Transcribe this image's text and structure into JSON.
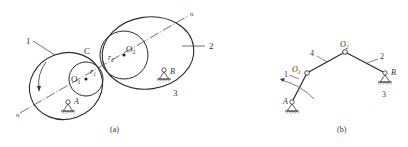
{
  "panel_a": {
    "caption": "(a)",
    "labels": {
      "link1": "1",
      "link2": "2",
      "link3": "3",
      "point_c": "C",
      "center_o1": "O",
      "center_o1_sub": "1",
      "center_o2": "O",
      "center_o2_sub": "2",
      "radius_r1": "r",
      "radius_r1_sub": "1",
      "radius_r2": "r",
      "radius_r2_sub": "2",
      "pivot_a": "A",
      "pivot_b": "B",
      "line_n_top": "n",
      "line_n_bottom": "n"
    }
  },
  "panel_b": {
    "caption": "(b)",
    "labels": {
      "link1": "1",
      "link2": "2",
      "link3": "3",
      "link4": "4",
      "joint_o1": "O",
      "joint_o1_sub": "1",
      "joint_o2": "O",
      "joint_o2_sub": "2",
      "pivot_a": "A",
      "pivot_b": "B"
    }
  },
  "colors": {
    "stroke": "#2a2a2a",
    "text": "#333333",
    "background": "#ffffff"
  }
}
